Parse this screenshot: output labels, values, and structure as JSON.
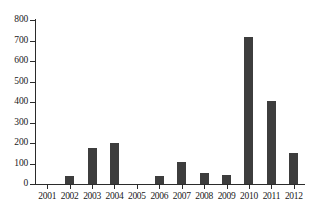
{
  "chart_data": {
    "type": "bar",
    "title": "",
    "subtitle": "",
    "xlabel": "",
    "ylabel": "",
    "categories": [
      "2001",
      "2002",
      "2003",
      "2004",
      "2005",
      "2006",
      "2007",
      "2008",
      "2009",
      "2010",
      "2011",
      "2012"
    ],
    "values": [
      0,
      40,
      175,
      200,
      0,
      40,
      105,
      55,
      45,
      715,
      405,
      150
    ],
    "ylim": [
      0,
      800
    ],
    "yticks": [
      0,
      100,
      200,
      300,
      400,
      500,
      600,
      700,
      800
    ],
    "ytick_labels": [
      "0",
      "100",
      "200",
      "300",
      "400",
      "500",
      "600",
      "700",
      "800"
    ],
    "grid": false,
    "legend": null,
    "legend_position": "none",
    "bar_color": "#3d3d3d",
    "axis_color": "#2b2b2b",
    "background_color": "#ffffff"
  }
}
